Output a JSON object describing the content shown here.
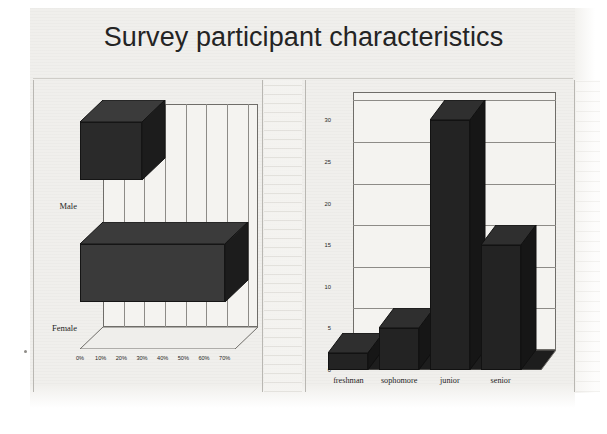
{
  "document": {
    "title": "Survey participant characteristics",
    "type": "scanned-slide"
  },
  "chart_data": [
    {
      "id": "gender-chart",
      "type": "bar",
      "orientation": "horizontal",
      "title": "",
      "xlabel": "",
      "ylabel": "",
      "categories": [
        "Male",
        "Female"
      ],
      "values": [
        30,
        70
      ],
      "tick_labels": [
        "0%",
        "10%",
        "20%",
        "30%",
        "40%",
        "50%",
        "60%",
        "70%"
      ],
      "tick_values": [
        0,
        10,
        20,
        30,
        40,
        50,
        60,
        70
      ],
      "xlim": [
        0,
        75
      ],
      "grid": "vertical",
      "legend": "none",
      "style": "3d",
      "series_color": "#2a2a2a"
    },
    {
      "id": "class-year-chart",
      "type": "bar",
      "orientation": "vertical",
      "title": "",
      "xlabel": "",
      "ylabel": "",
      "categories": [
        "freshman",
        "sophomore",
        "junior",
        "senior"
      ],
      "values": [
        2,
        5,
        30,
        15
      ],
      "tick_labels": [
        "0",
        "5",
        "10",
        "15",
        "20",
        "25",
        "30"
      ],
      "tick_values": [
        0,
        5,
        10,
        15,
        20,
        25,
        30
      ],
      "ylim": [
        0,
        31
      ],
      "grid": "horizontal",
      "legend": "none",
      "style": "3d",
      "series_color": "#232323"
    }
  ],
  "colors": {
    "page_background": "#ffffff",
    "slide_background": "#f0efec",
    "bar_front": "#2a2a2a",
    "bar_top": "#3b3b3b",
    "bar_side": "#1c1c1c",
    "axis": "#6f6d69",
    "grid": "#8d8b87",
    "text": "#1e1e1e",
    "title_text": "#242424"
  }
}
